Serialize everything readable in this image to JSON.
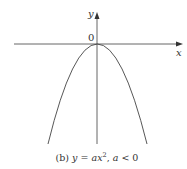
{
  "figure": {
    "x_axis_label": "x",
    "y_axis_label": "y",
    "origin_label": "0",
    "caption_prefix": "(b) ",
    "caption_eq_y": "y",
    "caption_eq_eq": " = ",
    "caption_eq_a": "a",
    "caption_eq_x": "x",
    "caption_eq_exp": "2",
    "caption_sep": ", ",
    "caption_cond_a": "a",
    "caption_cond_rest": " < 0",
    "curve": "downward parabola y = ax^2 with a < 0, vertex at origin",
    "colors": {
      "stroke": "#333333",
      "background": "#ffffff"
    }
  }
}
